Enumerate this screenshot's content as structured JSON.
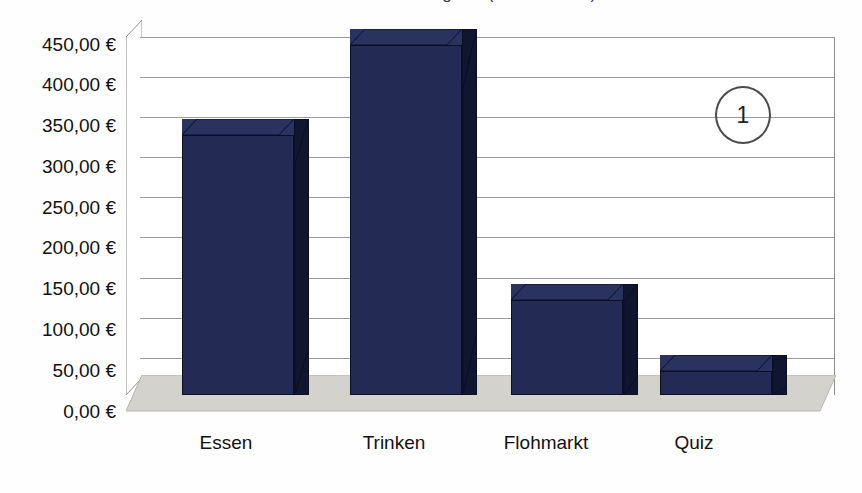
{
  "chart_data": {
    "type": "bar",
    "title": "Einnahmen nach Kategorie (Sommerfest)",
    "subtitle": "",
    "xlabel": "",
    "ylabel": "",
    "categories": [
      "Essen",
      "Trinken",
      "Flohmarkt",
      "Quiz"
    ],
    "values": [
      327,
      440,
      120,
      30
    ],
    "value_labels": [
      "327,00 €",
      "440,00 €",
      "120,00 €",
      "30,00 €"
    ],
    "ylim": [
      0,
      450
    ],
    "ytick_step": 50,
    "ytick_labels": [
      "450,00 €",
      "400,00 €",
      "350,00 €",
      "300,00 €",
      "250,00 €",
      "200,00 €",
      "150,00 €",
      "100,00 €",
      "50,00 €",
      "0,00 €"
    ],
    "ytick_values": [
      450,
      400,
      350,
      300,
      250,
      200,
      150,
      100,
      50,
      0
    ],
    "grid": true,
    "legend": false,
    "legend_position": "none",
    "three_d": true,
    "currency": "EUR",
    "number_format": "de-DE",
    "annotations": [
      {
        "name": "callout-1",
        "text": "1",
        "shape": "circle",
        "x_pct": 86.5,
        "y_pct": 22.5
      }
    ],
    "series": [
      {
        "name": "Einnahmen",
        "values": [
          327,
          440,
          120,
          30
        ]
      }
    ]
  },
  "colors": {
    "bar_front": "#232a54",
    "bar_side": "#11162f",
    "bar_top": "#2a3260",
    "floor": "#d4d2cd",
    "gridline": "#9a9a9a",
    "axis": "#8d8d8d",
    "text": "#111111",
    "background": "#fefefe",
    "annotation": "#4a4a4a"
  }
}
